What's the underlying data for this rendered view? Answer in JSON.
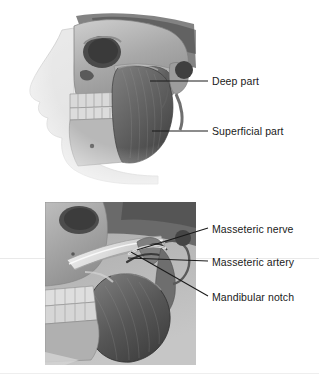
{
  "figure": {
    "background_color": "#ffffff",
    "label_color": "#1a1a1a",
    "leader_color": "#1a1a1a"
  },
  "panels": [
    {
      "id": "panel-top",
      "name": "lateral-skull-with-masseter",
      "description": "Lateral view of skull and face outline with masseter muscle",
      "frame": "none"
    },
    {
      "id": "panel-bottom",
      "name": "deep-dissection-zygomatic-arch",
      "description": "Close-up dissection with masseter reflected inferiorly",
      "frame": "rectangle"
    }
  ],
  "labels": [
    {
      "id": "deep",
      "text": "Deep part"
    },
    {
      "id": "superficial",
      "text": "Superficial part"
    },
    {
      "id": "nerve",
      "text": "Masseteric nerve"
    },
    {
      "id": "artery",
      "text": "Masseteric artery"
    },
    {
      "id": "notch",
      "text": "Mandibular notch"
    }
  ]
}
